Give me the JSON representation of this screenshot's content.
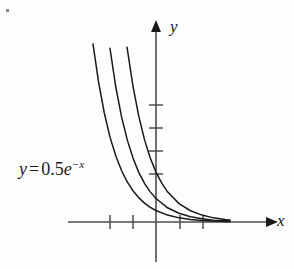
{
  "figure": {
    "background_color": "#fdfdfd",
    "ink_color": "#1a1a1a",
    "axis_color": "#4d4d4d",
    "corner_mark": "bullet-mark"
  },
  "labels": {
    "y_axis": "y",
    "x_axis": "x",
    "equation": {
      "lhs": "y",
      "equals": "=",
      "coefficient": "0.5",
      "base": "e",
      "exponent": "−x",
      "full_text": "y = 0.5e^{-x}"
    }
  },
  "chart_data": {
    "type": "line",
    "title": "",
    "subtitle": "",
    "xlabel": "x",
    "ylabel": "y",
    "grid": false,
    "legend": "none",
    "annotations": [
      {
        "text": "y = 0.5e^{-x}",
        "x": -2.0,
        "y": 2.1,
        "points_to": "left-most curve"
      }
    ],
    "axes": {
      "origin_px": {
        "x": 156,
        "y": 222
      },
      "unit_px": 23,
      "xlim": [
        -4.0,
        5.0
      ],
      "ylim": [
        -1.8,
        8.8
      ],
      "x_ticks": [
        -2,
        -1,
        1,
        2
      ],
      "y_ticks": [
        1,
        2,
        3,
        4
      ],
      "x_tick_labels": [
        "",
        "",
        "",
        ""
      ],
      "y_tick_labels": [
        "",
        "",
        "",
        ""
      ],
      "x_axis_arrow": true,
      "y_axis_arrow": true
    },
    "series": [
      {
        "name": "y = 0.5e^{-x} shifted left 2",
        "equation": "y = 0.5e^{-(x+2)}",
        "x": [
          -2.74,
          -2.5,
          -2.25,
          -2.0,
          -1.75,
          -1.5,
          -1.25,
          -1.0,
          -0.75,
          -0.5,
          -0.25,
          0.0,
          0.5,
          1.0,
          1.5,
          2.0,
          2.5,
          3.0,
          3.22
        ],
        "y": [
          7.74,
          6.1,
          4.75,
          3.69,
          2.88,
          2.24,
          1.74,
          1.36,
          1.06,
          0.82,
          0.64,
          0.5,
          0.3,
          0.18,
          0.11,
          0.07,
          0.04,
          0.02,
          0.02
        ]
      },
      {
        "name": "y = 0.5e^{-x} shifted left 1",
        "equation": "y = 0.5e^{-(x+1)}",
        "x": [
          -2.0,
          -1.75,
          -1.5,
          -1.25,
          -1.0,
          -0.75,
          -0.5,
          -0.25,
          0.0,
          0.5,
          1.0,
          1.5,
          2.0,
          2.5,
          3.0,
          3.22
        ],
        "y": [
          7.55,
          5.88,
          4.58,
          3.57,
          2.78,
          2.16,
          1.68,
          1.31,
          1.02,
          0.62,
          0.38,
          0.23,
          0.14,
          0.08,
          0.05,
          0.04
        ],
        "note": "middle curve"
      },
      {
        "name": "y = 0.5e^{-x}",
        "equation": "y = 0.5e^{-x}",
        "x": [
          -1.26,
          -1.0,
          -0.75,
          -0.5,
          -0.25,
          0.0,
          0.25,
          0.5,
          1.0,
          1.5,
          2.0,
          2.5,
          3.0,
          3.22
        ],
        "y": [
          7.6,
          5.9,
          4.6,
          3.58,
          2.78,
          2.17,
          1.69,
          1.31,
          0.8,
          0.49,
          0.3,
          0.18,
          0.11,
          0.09
        ],
        "note": "right-most curve; family of vertically/horizontally shifted exponential decay curves"
      }
    ]
  }
}
